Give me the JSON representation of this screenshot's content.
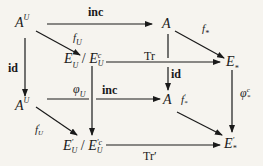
{
  "diagram": {
    "type": "commutative-diagram",
    "nodes": {
      "AU_top": {
        "base": "A",
        "sup": "U"
      },
      "A_top": {
        "base": "A"
      },
      "EU_quot": {
        "base1": "E",
        "sub1": "U",
        "sep": " / ",
        "base2": "E",
        "sup2": "c",
        "sub2": "U"
      },
      "Estar_top": {
        "base": "E",
        "sub": "*"
      },
      "AU_bottom": {
        "base": "A",
        "sup": "U"
      },
      "A_mid": {
        "base": "A"
      },
      "EUprime_quot": {
        "base1": "E",
        "sup1": "′",
        "sub1": "U",
        "sep": " / ",
        "base2": "E",
        "sup2": "′c",
        "sub2": "U"
      },
      "Estar_prime": {
        "base": "E",
        "sup": "′",
        "sub": "*"
      }
    },
    "arrows": {
      "inc_top": {
        "label": "inc",
        "from": "A^U",
        "to": "A"
      },
      "fU": {
        "base": "f",
        "sub": "U",
        "from": "A^U",
        "to": "E_U/E_U^c"
      },
      "fstar": {
        "base": "f",
        "sub": "*",
        "from": "A",
        "to": "E_*"
      },
      "Tr": {
        "label": "Tr",
        "from": "E_U/E_U^c",
        "to": "E_*"
      },
      "id_left": {
        "label": "id",
        "from": "A^U",
        "to": "A^U"
      },
      "id_mid": {
        "label": "id",
        "from": "A",
        "to": "A"
      },
      "phiU": {
        "base": "φ",
        "sub": "U",
        "from": "E_U/E_U^c",
        "to": "E'_U/E'^c_U"
      },
      "inc_mid": {
        "label": "inc",
        "from": "A^U",
        "to": "A"
      },
      "phic_star": {
        "base": "φ",
        "sup": "c",
        "sub": "*",
        "from": "E_*",
        "to": "E'_*"
      },
      "fprimeU": {
        "base": "f",
        "sup": "′",
        "sub": "U",
        "from": "A^U",
        "to": "E'_U/E'^c_U"
      },
      "fprimestar": {
        "base": "f",
        "sup": "′",
        "sub": "*",
        "from": "A",
        "to": "E'_*"
      },
      "Trprime": {
        "label": "Tr′",
        "from": "E'_U/E'^c_U",
        "to": "E'_*"
      }
    },
    "colors": {
      "background": "#f6f4ef",
      "ink": "#1a1a1a"
    }
  }
}
